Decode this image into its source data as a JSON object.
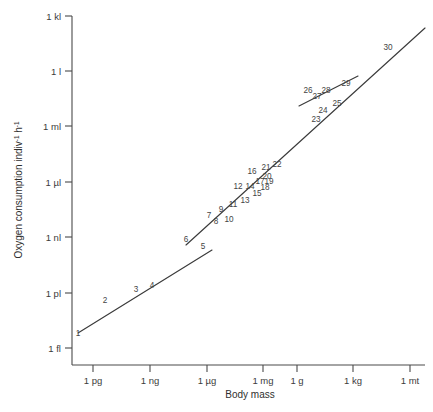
{
  "chart_data": {
    "type": "scatter",
    "title": "",
    "xlabel": "Body mass",
    "ylabel": "Oxygen consumption indiv⁻¹ h⁻¹",
    "ylabel_parts": {
      "main": "Oxygen consumption indiv",
      "sup1": "-1",
      "mid": " h",
      "sup2": "-1"
    },
    "grid": false,
    "legend": "none",
    "scale": "log-log",
    "xticks": [
      "1 pg",
      "1 ng",
      "1 µg",
      "1 mg",
      "1 g",
      "1 kg",
      "1 mt"
    ],
    "yticks": [
      "1 kl",
      "1 l",
      "1 ml",
      "1 µl",
      "1 nl",
      "1 pl",
      "1 fl"
    ],
    "xlim": [
      "1 pg",
      "1 mt"
    ],
    "ylim": [
      "1 fl",
      "1 kl"
    ],
    "point_count": 30,
    "point_labels": [
      "1",
      "2",
      "3",
      "4",
      "5",
      "6",
      "7",
      "8",
      "9",
      "10",
      "11",
      "12",
      "13",
      "14",
      "15",
      "16",
      "17",
      "18",
      "19",
      "20",
      "21",
      "22",
      "23",
      "24",
      "25",
      "26",
      "27",
      "28",
      "29",
      "30"
    ],
    "segments": [
      {
        "name": "lower-line",
        "labels": [
          "1",
          "2",
          "3",
          "4",
          "5"
        ]
      },
      {
        "name": "main-line",
        "labels": [
          "6",
          "7",
          "8",
          "9",
          "10",
          "11",
          "12",
          "13",
          "14",
          "15",
          "16",
          "17",
          "18",
          "19",
          "20",
          "21",
          "22",
          "23",
          "24",
          "25",
          "30"
        ]
      },
      {
        "name": "upper-short-line",
        "labels": [
          "26",
          "27",
          "28",
          "29"
        ]
      }
    ],
    "points": [
      {
        "n": "1",
        "x": 83,
        "y": 330,
        "lx": 78,
        "ly": 336
      },
      {
        "n": "2",
        "x": 112,
        "y": 311,
        "lx": 105,
        "ly": 303
      },
      {
        "n": "3",
        "x": 143,
        "y": 291,
        "lx": 136,
        "ly": 292
      },
      {
        "n": "4",
        "x": 155,
        "y": 285,
        "lx": 152,
        "ly": 288
      },
      {
        "n": "5",
        "x": 208,
        "y": 251,
        "lx": 203,
        "ly": 249
      },
      {
        "n": "6",
        "x": 190,
        "y": 243,
        "lx": 186,
        "ly": 242
      },
      {
        "n": "7",
        "x": 210,
        "y": 224,
        "lx": 209,
        "ly": 218
      },
      {
        "n": "8",
        "x": 216,
        "y": 222,
        "lx": 216,
        "ly": 224
      },
      {
        "n": "9",
        "x": 221,
        "y": 214,
        "lx": 221,
        "ly": 212
      },
      {
        "n": "10",
        "x": 231,
        "y": 216,
        "lx": 229,
        "ly": 222
      },
      {
        "n": "11",
        "x": 236,
        "y": 203,
        "lx": 233,
        "ly": 207
      },
      {
        "n": "12",
        "x": 242,
        "y": 189,
        "lx": 238,
        "ly": 189
      },
      {
        "n": "13",
        "x": 247,
        "y": 199,
        "lx": 245,
        "ly": 203
      },
      {
        "n": "14",
        "x": 253,
        "y": 188,
        "lx": 250,
        "ly": 189
      },
      {
        "n": "15",
        "x": 259,
        "y": 196,
        "lx": 257,
        "ly": 196
      },
      {
        "n": "16",
        "x": 256,
        "y": 173,
        "lx": 252,
        "ly": 174
      },
      {
        "n": "17",
        "x": 261,
        "y": 183,
        "lx": 260,
        "ly": 184
      },
      {
        "n": "18",
        "x": 266,
        "y": 189,
        "lx": 265,
        "ly": 190
      },
      {
        "n": "19",
        "x": 271,
        "y": 183,
        "lx": 269,
        "ly": 184
      },
      {
        "n": "20",
        "x": 269,
        "y": 177,
        "lx": 267,
        "ly": 179
      },
      {
        "n": "21",
        "x": 268,
        "y": 168,
        "lx": 266,
        "ly": 170
      },
      {
        "n": "22",
        "x": 280,
        "y": 165,
        "lx": 277,
        "ly": 167
      },
      {
        "n": "23",
        "x": 320,
        "y": 118,
        "lx": 316,
        "ly": 122
      },
      {
        "n": "24",
        "x": 327,
        "y": 110,
        "lx": 323,
        "ly": 113
      },
      {
        "n": "25",
        "x": 340,
        "y": 104,
        "lx": 337,
        "ly": 106
      },
      {
        "n": "26",
        "x": 313,
        "y": 92,
        "lx": 308,
        "ly": 93
      },
      {
        "n": "27",
        "x": 320,
        "y": 98,
        "lx": 317,
        "ly": 99
      },
      {
        "n": "28",
        "x": 329,
        "y": 92,
        "lx": 326,
        "ly": 93
      },
      {
        "n": "29",
        "x": 349,
        "y": 85,
        "lx": 346,
        "ly": 86
      },
      {
        "n": "30",
        "x": 392,
        "y": 48,
        "lx": 388,
        "ly": 50
      }
    ],
    "axis_geometry": {
      "x_axis_y": 365,
      "y_axis_x": 72,
      "x_tick_positions": [
        93,
        150,
        207,
        263,
        297,
        353,
        410
      ],
      "y_tick_positions": [
        16,
        71,
        126,
        182,
        237,
        293,
        348
      ]
    },
    "lines": [
      {
        "name": "lower-line",
        "path": "M 78,333 L 212,250"
      },
      {
        "name": "main-line",
        "path": "M 186,245 L 425,28"
      },
      {
        "name": "upper-short-line",
        "path": "M 299,106 L 358,76"
      }
    ],
    "colors": {
      "axis": "#4a4a4a",
      "curve": "#3a3a3a",
      "text": "#3c3c3c",
      "background": "#ffffff"
    }
  }
}
